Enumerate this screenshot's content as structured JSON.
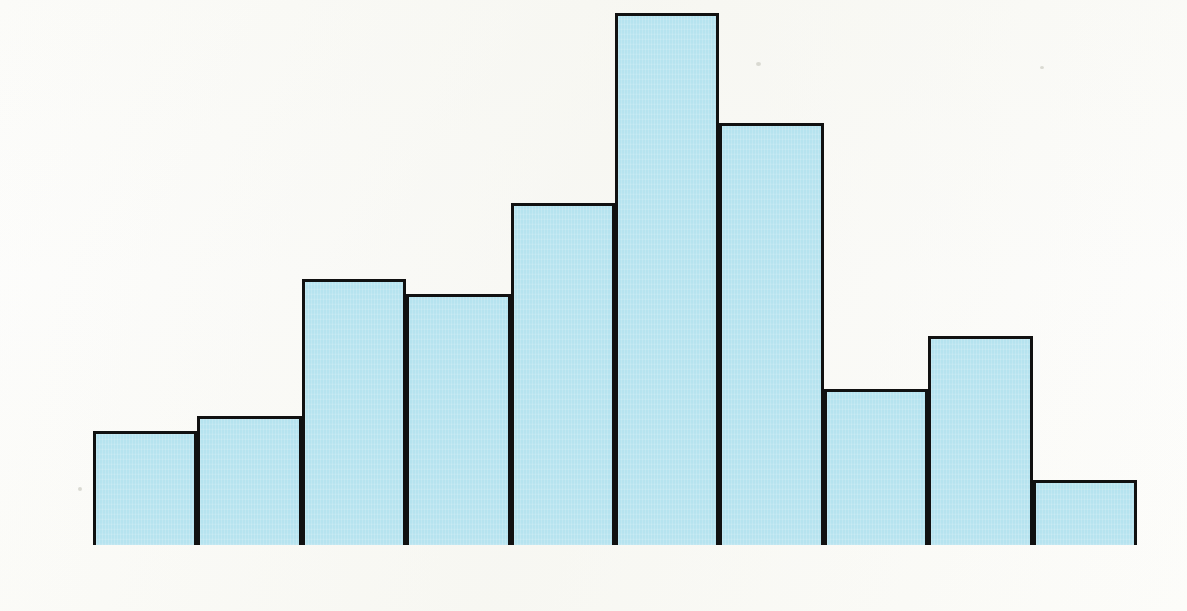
{
  "chart_data": {
    "type": "bar",
    "title": "Taviston School",
    "xlabel": "Score (%)",
    "ylabel": "Number of pupils",
    "categories": [
      "0–10",
      "11–20",
      "21–30",
      "31–40",
      "41–50",
      "51–60",
      "61–70",
      "71–80",
      "81–90",
      "91–100"
    ],
    "values": [
      15,
      17,
      35,
      33,
      45,
      70,
      55.5,
      20.5,
      27.5,
      8.5
    ],
    "ylim": [
      0,
      70
    ],
    "ytick_labels": [
      "0",
      "10",
      "20",
      "30",
      "40",
      "50",
      "60",
      "70"
    ],
    "ytick_values": [
      0,
      10,
      20,
      30,
      40,
      50,
      60,
      70
    ],
    "gridline_values": [
      5,
      10,
      15,
      20,
      25,
      30,
      35,
      40,
      45,
      50,
      55,
      60,
      65,
      70
    ],
    "grid": true,
    "legend": "none",
    "bar_fill_color": "#b6e3ef",
    "bar_edge_color": "#111111",
    "gridline_color": "#63a7dd"
  }
}
